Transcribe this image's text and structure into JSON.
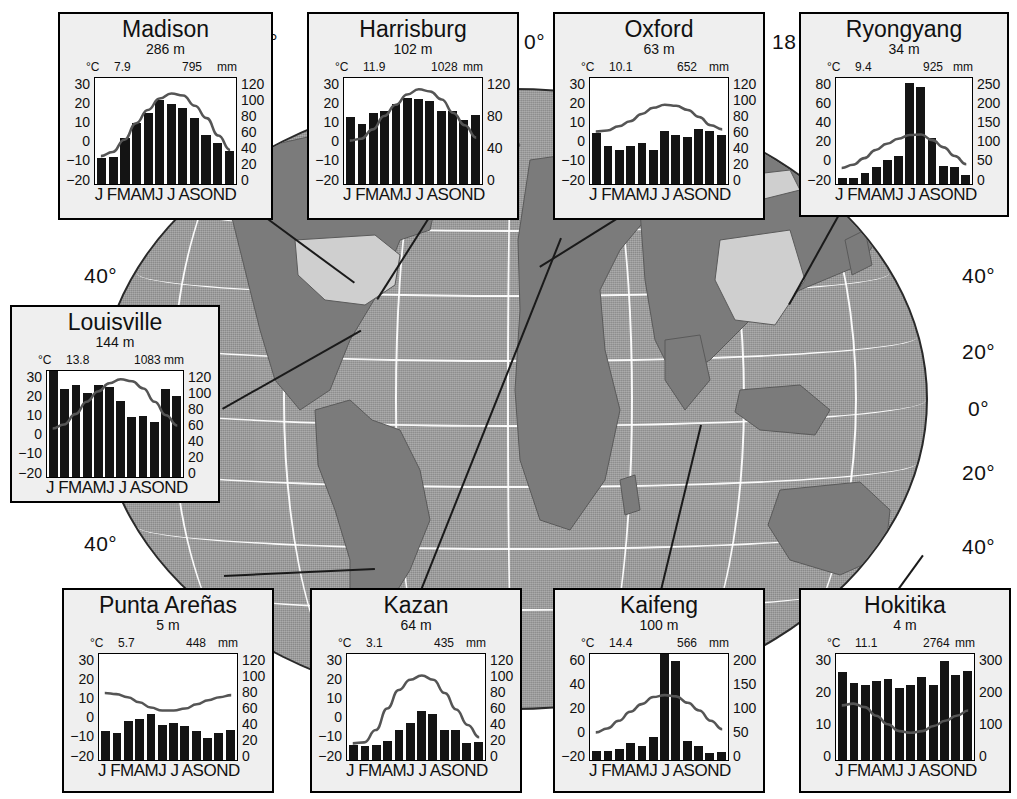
{
  "figure": {
    "type": "climate-diagram-map",
    "map": {
      "projection": "globe",
      "ocean_color": "#9b9b9b",
      "land_color": "#7b7b7b",
      "highlight_color": "#cfcfcf",
      "graticule_color": "#ffffff",
      "longitude_labels": [
        {
          "text": "0°",
          "pos": "top-left-partial"
        },
        {
          "text": "0°",
          "pos": "top-center"
        },
        {
          "text": "18",
          "pos": "top-right-partial"
        }
      ],
      "latitude_labels_left": [
        "40°",
        "40°"
      ],
      "latitude_labels_right": [
        "40°",
        "20°",
        "0°",
        "20°",
        "40°"
      ]
    },
    "axis_labels": {
      "temp_unit": "°C",
      "precip_unit": "mm",
      "months": "J FMAMJ J ASOND"
    }
  },
  "stations": [
    {
      "name": "Madison",
      "elevation": "286 m",
      "mean_temp": "7.9",
      "annual_precip": "795",
      "temp_ticks": [
        "30",
        "20",
        "10",
        "0",
        "−10",
        "−20"
      ],
      "temp_range": [
        -20,
        30
      ],
      "precip_ticks": [
        "120",
        "100",
        "80",
        "60",
        "40",
        "20",
        "0"
      ],
      "precip_range": [
        0,
        120
      ],
      "precip": [
        29,
        30,
        52,
        68,
        80,
        95,
        90,
        85,
        74,
        55,
        46,
        37
      ],
      "temperature": [
        -8.0,
        -6.0,
        0.0,
        8.0,
        14.5,
        20.0,
        22.5,
        21.5,
        16.5,
        10.5,
        2.0,
        -5.0
      ]
    },
    {
      "name": "Harrisburg",
      "elevation": "102 m",
      "mean_temp": "11.9",
      "annual_precip": "1028",
      "temp_ticks": [
        "30",
        "20",
        "10",
        "0",
        "−10",
        "−20"
      ],
      "temp_range": [
        -20,
        30
      ],
      "precip_ticks": [
        "120",
        "80",
        "40",
        "0"
      ],
      "precip_range": [
        0,
        120
      ],
      "precip": [
        75,
        67,
        80,
        82,
        90,
        97,
        96,
        94,
        82,
        82,
        72,
        78
      ],
      "temperature": [
        -0.5,
        0.5,
        5.0,
        11.5,
        17.0,
        22.0,
        24.5,
        23.5,
        19.5,
        13.0,
        7.0,
        1.0
      ]
    },
    {
      "name": "Oxford",
      "elevation": "63 m",
      "mean_temp": "10.1",
      "annual_precip": "652",
      "temp_ticks": [
        "30",
        "20",
        "10",
        "0",
        "−10",
        "−20"
      ],
      "temp_range": [
        -20,
        30
      ],
      "precip_ticks": [
        "120",
        "100",
        "80",
        "60",
        "40",
        "20",
        "0"
      ],
      "precip_range": [
        0,
        120
      ],
      "precip": [
        57,
        42,
        38,
        43,
        46,
        38,
        60,
        55,
        53,
        62,
        60,
        55
      ],
      "temperature": [
        4.0,
        4.5,
        6.5,
        9.0,
        12.5,
        15.5,
        17.0,
        16.5,
        14.5,
        11.0,
        7.0,
        5.0
      ]
    },
    {
      "name": "Ryongyang",
      "elevation": "34 m",
      "mean_temp": "9.4",
      "annual_precip": "925",
      "temp_ticks": [
        "80",
        "60",
        "40",
        "20",
        "0",
        "−20"
      ],
      "temp_range": [
        -20,
        80
      ],
      "precip_ticks": [
        "250",
        "200",
        "150",
        "100",
        "50",
        "0"
      ],
      "precip_range": [
        0,
        250
      ],
      "precip": [
        14,
        12,
        26,
        40,
        56,
        66,
        237,
        228,
        107,
        42,
        40,
        20
      ],
      "temperature": [
        -7.5,
        -4.5,
        2.0,
        10.0,
        16.0,
        21.0,
        24.5,
        25.0,
        19.5,
        12.5,
        4.0,
        -4.0
      ]
    },
    {
      "name": "Louisville",
      "elevation": "144 m",
      "mean_temp": "13.8",
      "annual_precip": "1083",
      "temp_ticks": [
        "30",
        "20",
        "10",
        "0",
        "−10",
        "−20"
      ],
      "temp_range": [
        -20,
        30
      ],
      "precip_ticks": [
        "120",
        "100",
        "80",
        "60",
        "40",
        "20",
        "0"
      ],
      "precip_range": [
        0,
        120
      ],
      "precip": [
        120,
        99,
        104,
        95,
        104,
        101,
        85,
        67,
        69,
        62,
        99,
        91
      ],
      "temperature": [
        2.0,
        4.0,
        9.0,
        15.0,
        20.0,
        24.0,
        26.0,
        25.0,
        21.5,
        15.0,
        8.5,
        3.5
      ]
    },
    {
      "name": "Punta Areñas",
      "elevation": "5 m",
      "mean_temp": "5.7",
      "annual_precip": "448",
      "temp_ticks": [
        "30",
        "20",
        "10",
        "0",
        "−10",
        "−20"
      ],
      "temp_range": [
        -20,
        30
      ],
      "precip_ticks": [
        "120",
        "100",
        "80",
        "60",
        "40",
        "20",
        "0"
      ],
      "precip_range": [
        0,
        120
      ],
      "precip": [
        32,
        30,
        44,
        46,
        51,
        39,
        41,
        38,
        32,
        24,
        30,
        33
      ],
      "temperature": [
        11.0,
        10.5,
        9.0,
        6.5,
        4.0,
        2.5,
        2.5,
        3.5,
        5.5,
        7.5,
        9.0,
        10.0
      ]
    },
    {
      "name": "Kazan",
      "elevation": "64 m",
      "mean_temp": "3.1",
      "annual_precip": "435",
      "temp_ticks": [
        "30",
        "20",
        "10",
        "0",
        "−10",
        "−20"
      ],
      "temp_range": [
        -20,
        30
      ],
      "precip_ticks": [
        "120",
        "100",
        "80",
        "60",
        "40",
        "20",
        "0"
      ],
      "precip_range": [
        0,
        120
      ],
      "precip": [
        16,
        15,
        16,
        21,
        33,
        41,
        55,
        51,
        33,
        33,
        19,
        20
      ],
      "temperature": [
        -13.5,
        -13.0,
        -7.0,
        3.5,
        12.5,
        17.5,
        19.5,
        17.5,
        11.0,
        3.0,
        -4.5,
        -10.5
      ]
    },
    {
      "name": "Kaifeng",
      "elevation": "100 m",
      "mean_temp": "14.4",
      "annual_precip": "566",
      "temp_ticks": [
        "60",
        "40",
        "20",
        "0",
        "−20"
      ],
      "temp_range": [
        -20,
        60
      ],
      "precip_ticks": [
        "200",
        "150",
        "100",
        "50",
        "0"
      ],
      "precip_range": [
        0,
        200
      ],
      "precip": [
        16,
        16,
        20,
        32,
        25,
        42,
        200,
        185,
        35,
        26,
        13,
        14
      ],
      "temperature": [
        -1.0,
        2.0,
        8.0,
        15.0,
        21.0,
        26.5,
        28.0,
        27.0,
        22.0,
        16.0,
        8.0,
        1.5
      ]
    },
    {
      "name": "Hokitika",
      "elevation": "4 m",
      "mean_temp": "11.1",
      "annual_precip": "2764",
      "temp_ticks": [
        "30",
        "20",
        "10",
        "0"
      ],
      "temp_range": [
        0,
        30
      ],
      "precip_ticks": [
        "300",
        "200",
        "100",
        "0"
      ],
      "precip_range": [
        0,
        300
      ],
      "precip": [
        248,
        216,
        212,
        221,
        229,
        202,
        211,
        234,
        211,
        278,
        240,
        251
      ],
      "temperature": [
        15.0,
        15.5,
        14.5,
        12.0,
        9.5,
        7.5,
        7.0,
        7.5,
        9.0,
        10.5,
        12.0,
        13.5
      ]
    }
  ]
}
